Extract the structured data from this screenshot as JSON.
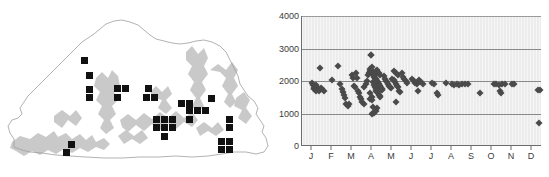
{
  "figure": {
    "panels": [
      {
        "id": "map",
        "name": "distribution-map"
      },
      {
        "id": "chart",
        "name": "elevation-by-month-scatter"
      }
    ]
  },
  "map": {
    "region_name": "Bhutan",
    "marker_symbol": "black-square",
    "marker_meaning": "occurrence record",
    "outline_color": "#aaaaaa",
    "relief_color": "#c9c9c9",
    "marker_color": "#111111",
    "markers": [
      {
        "x": 84,
        "y": 60
      },
      {
        "x": 89,
        "y": 75
      },
      {
        "x": 89,
        "y": 89
      },
      {
        "x": 89,
        "y": 97
      },
      {
        "x": 117,
        "y": 88
      },
      {
        "x": 125,
        "y": 88
      },
      {
        "x": 117,
        "y": 97
      },
      {
        "x": 148,
        "y": 88
      },
      {
        "x": 146,
        "y": 97
      },
      {
        "x": 154,
        "y": 97
      },
      {
        "x": 181,
        "y": 103
      },
      {
        "x": 189,
        "y": 103
      },
      {
        "x": 211,
        "y": 98
      },
      {
        "x": 189,
        "y": 110
      },
      {
        "x": 197,
        "y": 110
      },
      {
        "x": 205,
        "y": 110
      },
      {
        "x": 189,
        "y": 119
      },
      {
        "x": 156,
        "y": 119
      },
      {
        "x": 164,
        "y": 119
      },
      {
        "x": 172,
        "y": 119
      },
      {
        "x": 156,
        "y": 127
      },
      {
        "x": 164,
        "y": 127
      },
      {
        "x": 172,
        "y": 127
      },
      {
        "x": 164,
        "y": 136
      },
      {
        "x": 229,
        "y": 119
      },
      {
        "x": 229,
        "y": 127
      },
      {
        "x": 221,
        "y": 141
      },
      {
        "x": 229,
        "y": 141
      },
      {
        "x": 221,
        "y": 149
      },
      {
        "x": 229,
        "y": 149
      },
      {
        "x": 71,
        "y": 144
      },
      {
        "x": 66,
        "y": 152
      }
    ]
  },
  "chart_data": {
    "type": "scatter",
    "title": "",
    "xlabel": "",
    "ylabel": "",
    "x_tick_labels": [
      "J",
      "F",
      "M",
      "A",
      "M",
      "J",
      "J",
      "A",
      "S",
      "O",
      "N",
      "D"
    ],
    "x_tick_full": [
      "January",
      "February",
      "March",
      "April",
      "May",
      "June",
      "July",
      "August",
      "September",
      "October",
      "November",
      "December"
    ],
    "y_tick_labels": [
      "4000",
      "3000",
      "2000",
      "1000",
      "0"
    ],
    "y_tick_values": [
      4000,
      3000,
      2000,
      1000,
      0
    ],
    "ylim": [
      0,
      4000
    ],
    "xlim": [
      0.5,
      12.5
    ],
    "grid": "horizontal",
    "gridline_values": [
      4000,
      3000,
      2000,
      1000
    ],
    "legend": "none",
    "marker": "filled-diamond",
    "marker_color": "#4a4a4a",
    "plot_background": "#ececec",
    "points": [
      {
        "m": 1.0,
        "v": 1950
      },
      {
        "m": 1.05,
        "v": 1880
      },
      {
        "m": 1.1,
        "v": 1800
      },
      {
        "m": 1.12,
        "v": 1760
      },
      {
        "m": 1.18,
        "v": 1700
      },
      {
        "m": 1.22,
        "v": 1880
      },
      {
        "m": 1.25,
        "v": 1820
      },
      {
        "m": 1.3,
        "v": 1760
      },
      {
        "m": 1.34,
        "v": 1700
      },
      {
        "m": 1.4,
        "v": 2400
      },
      {
        "m": 1.45,
        "v": 1800
      },
      {
        "m": 1.52,
        "v": 1760
      },
      {
        "m": 1.58,
        "v": 1700
      },
      {
        "m": 2.0,
        "v": 2020
      },
      {
        "m": 2.3,
        "v": 2450
      },
      {
        "m": 2.42,
        "v": 1900
      },
      {
        "m": 2.5,
        "v": 1760
      },
      {
        "m": 2.55,
        "v": 1660
      },
      {
        "m": 2.6,
        "v": 1560
      },
      {
        "m": 2.66,
        "v": 1480
      },
      {
        "m": 2.72,
        "v": 1300
      },
      {
        "m": 2.78,
        "v": 1240
      },
      {
        "m": 2.84,
        "v": 1280
      },
      {
        "m": 3.0,
        "v": 2180
      },
      {
        "m": 3.06,
        "v": 2100
      },
      {
        "m": 3.1,
        "v": 1860
      },
      {
        "m": 3.14,
        "v": 1820
      },
      {
        "m": 3.2,
        "v": 2250
      },
      {
        "m": 3.26,
        "v": 2080
      },
      {
        "m": 3.3,
        "v": 1700
      },
      {
        "m": 3.36,
        "v": 1620
      },
      {
        "m": 3.42,
        "v": 1520
      },
      {
        "m": 3.46,
        "v": 1440
      },
      {
        "m": 3.52,
        "v": 1340
      },
      {
        "m": 3.58,
        "v": 1280
      },
      {
        "m": 3.62,
        "v": 1820
      },
      {
        "m": 3.68,
        "v": 1900
      },
      {
        "m": 3.74,
        "v": 2000
      },
      {
        "m": 3.8,
        "v": 2180
      },
      {
        "m": 3.84,
        "v": 2240
      },
      {
        "m": 3.88,
        "v": 2300
      },
      {
        "m": 3.9,
        "v": 2380
      },
      {
        "m": 3.94,
        "v": 2800
      },
      {
        "m": 3.96,
        "v": 2810
      },
      {
        "m": 4.0,
        "v": 2430
      },
      {
        "m": 4.02,
        "v": 2320
      },
      {
        "m": 4.04,
        "v": 2260
      },
      {
        "m": 4.06,
        "v": 2220
      },
      {
        "m": 4.08,
        "v": 2180
      },
      {
        "m": 4.1,
        "v": 2150
      },
      {
        "m": 4.12,
        "v": 2120
      },
      {
        "m": 4.14,
        "v": 2100
      },
      {
        "m": 4.16,
        "v": 2080
      },
      {
        "m": 4.18,
        "v": 2060
      },
      {
        "m": 4.2,
        "v": 2040
      },
      {
        "m": 4.22,
        "v": 2020
      },
      {
        "m": 4.24,
        "v": 2000
      },
      {
        "m": 4.26,
        "v": 1980
      },
      {
        "m": 4.28,
        "v": 1960
      },
      {
        "m": 4.3,
        "v": 1940
      },
      {
        "m": 4.32,
        "v": 1920
      },
      {
        "m": 4.34,
        "v": 1900
      },
      {
        "m": 4.36,
        "v": 1880
      },
      {
        "m": 4.38,
        "v": 1860
      },
      {
        "m": 4.4,
        "v": 1840
      },
      {
        "m": 4.42,
        "v": 1820
      },
      {
        "m": 4.44,
        "v": 1800
      },
      {
        "m": 4.46,
        "v": 1780
      },
      {
        "m": 4.48,
        "v": 1760
      },
      {
        "m": 4.5,
        "v": 1740
      },
      {
        "m": 4.52,
        "v": 1720
      },
      {
        "m": 4.06,
        "v": 1960
      },
      {
        "m": 4.1,
        "v": 1880
      },
      {
        "m": 4.14,
        "v": 1820
      },
      {
        "m": 4.18,
        "v": 1760
      },
      {
        "m": 4.22,
        "v": 1700
      },
      {
        "m": 4.26,
        "v": 1660
      },
      {
        "m": 4.3,
        "v": 1620
      },
      {
        "m": 4.34,
        "v": 1580
      },
      {
        "m": 4.38,
        "v": 1540
      },
      {
        "m": 4.42,
        "v": 1500
      },
      {
        "m": 4.14,
        "v": 2200
      },
      {
        "m": 4.18,
        "v": 2260
      },
      {
        "m": 4.22,
        "v": 2300
      },
      {
        "m": 4.26,
        "v": 2340
      },
      {
        "m": 4.34,
        "v": 2240
      },
      {
        "m": 4.4,
        "v": 2180
      },
      {
        "m": 3.98,
        "v": 1520
      },
      {
        "m": 4.02,
        "v": 1420
      },
      {
        "m": 4.04,
        "v": 1200
      },
      {
        "m": 4.0,
        "v": 1000
      },
      {
        "m": 4.06,
        "v": 1010
      },
      {
        "m": 4.12,
        "v": 1020
      },
      {
        "m": 4.18,
        "v": 1080
      },
      {
        "m": 4.24,
        "v": 1180
      },
      {
        "m": 3.92,
        "v": 1460
      },
      {
        "m": 3.88,
        "v": 1640
      },
      {
        "m": 4.6,
        "v": 2140
      },
      {
        "m": 4.66,
        "v": 2060
      },
      {
        "m": 4.7,
        "v": 2000
      },
      {
        "m": 4.76,
        "v": 1960
      },
      {
        "m": 4.8,
        "v": 1900
      },
      {
        "m": 4.86,
        "v": 1860
      },
      {
        "m": 4.92,
        "v": 1820
      },
      {
        "m": 4.96,
        "v": 1780
      },
      {
        "m": 5.02,
        "v": 2060
      },
      {
        "m": 5.08,
        "v": 2020
      },
      {
        "m": 5.14,
        "v": 1960
      },
      {
        "m": 5.2,
        "v": 1900
      },
      {
        "m": 5.26,
        "v": 1860
      },
      {
        "m": 5.32,
        "v": 1820
      },
      {
        "m": 5.1,
        "v": 2320
      },
      {
        "m": 5.18,
        "v": 2260
      },
      {
        "m": 5.28,
        "v": 2180
      },
      {
        "m": 5.36,
        "v": 1700
      },
      {
        "m": 5.42,
        "v": 1660
      },
      {
        "m": 5.2,
        "v": 1340
      },
      {
        "m": 5.5,
        "v": 2240
      },
      {
        "m": 5.56,
        "v": 2120
      },
      {
        "m": 5.62,
        "v": 2060
      },
      {
        "m": 5.68,
        "v": 2000
      },
      {
        "m": 5.74,
        "v": 1940
      },
      {
        "m": 6.0,
        "v": 2060
      },
      {
        "m": 6.08,
        "v": 2000
      },
      {
        "m": 6.16,
        "v": 1940
      },
      {
        "m": 6.24,
        "v": 1900
      },
      {
        "m": 6.36,
        "v": 2040
      },
      {
        "m": 6.46,
        "v": 1980
      },
      {
        "m": 6.56,
        "v": 1920
      },
      {
        "m": 6.3,
        "v": 1700
      },
      {
        "m": 7.0,
        "v": 1940
      },
      {
        "m": 7.12,
        "v": 1900
      },
      {
        "m": 7.24,
        "v": 1620
      },
      {
        "m": 7.32,
        "v": 1580
      },
      {
        "m": 7.7,
        "v": 1940
      },
      {
        "m": 8.0,
        "v": 1920
      },
      {
        "m": 8.12,
        "v": 1880
      },
      {
        "m": 8.24,
        "v": 1900
      },
      {
        "m": 8.36,
        "v": 1880
      },
      {
        "m": 8.52,
        "v": 1920
      },
      {
        "m": 8.64,
        "v": 1900
      },
      {
        "m": 8.78,
        "v": 1920
      },
      {
        "m": 9.4,
        "v": 1620
      },
      {
        "m": 10.1,
        "v": 1920
      },
      {
        "m": 10.22,
        "v": 1900
      },
      {
        "m": 10.34,
        "v": 1880
      },
      {
        "m": 10.4,
        "v": 1700
      },
      {
        "m": 10.44,
        "v": 1620
      },
      {
        "m": 10.52,
        "v": 1900
      },
      {
        "m": 10.64,
        "v": 1920
      },
      {
        "m": 11.0,
        "v": 1920
      },
      {
        "m": 11.12,
        "v": 1900
      },
      {
        "m": 12.3,
        "v": 1720
      },
      {
        "m": 12.4,
        "v": 1720
      },
      {
        "m": 12.34,
        "v": 700
      }
    ]
  }
}
